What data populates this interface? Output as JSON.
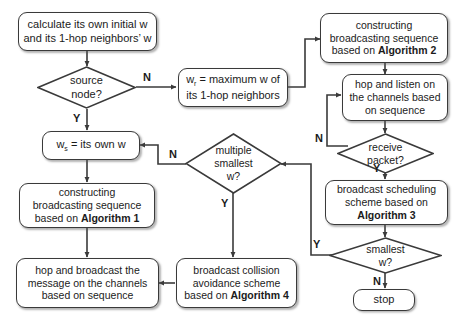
{
  "diagram": {
    "colors": {
      "stroke": "#3a3a3a",
      "text": "#1b1b1b",
      "background": "#ffffff"
    },
    "nodes": {
      "calc_initial_w": {
        "shape": "process",
        "line1": "calculate its own initial w",
        "line2": "and its 1-hop neighbors’ w"
      },
      "source_node": {
        "shape": "decision",
        "line1": "source",
        "line2": "node?"
      },
      "wr_max": {
        "shape": "process",
        "line1": "w",
        "sub1": "r",
        "line1b": " = maximum w of",
        "line2": "its 1-hop neighbors"
      },
      "ws_own": {
        "shape": "process",
        "line1": "w",
        "sub1": "s",
        "line1b": " = its own w"
      },
      "construct_alg1": {
        "shape": "process",
        "line1": "constructing",
        "line2": "broadcasting sequence",
        "line3_pre": "based on ",
        "line3_bold": "Algorithm 1"
      },
      "construct_alg2": {
        "shape": "process",
        "line1": "constructing",
        "line2": "broadcasting sequence",
        "line3_pre": "based on ",
        "line3_bold": "Algorithm 2"
      },
      "hop_listen": {
        "shape": "process",
        "line1": "hop and listen on",
        "line2": "the channels based",
        "line3": "on sequence"
      },
      "receive_packet": {
        "shape": "decision",
        "line1": "receive",
        "line2": "packet?"
      },
      "broadcast_sched_alg3": {
        "shape": "process",
        "line1": "broadcast scheduling",
        "line2": "scheme based on",
        "line3_bold": "Algorithm 3"
      },
      "smallest_w": {
        "shape": "decision",
        "line1": "smallest",
        "line2": "w?"
      },
      "stop": {
        "shape": "terminal",
        "line1": "stop"
      },
      "multiple_smallest_w": {
        "shape": "decision",
        "line1": "multiple",
        "line2": "smallest",
        "line3": "w?"
      },
      "collision_avoid_alg4": {
        "shape": "process",
        "line1": "broadcast collision",
        "line2": "avoidance scheme",
        "line3_pre": "based on ",
        "line3_bold": "Algorithm 4"
      },
      "hop_broadcast": {
        "shape": "process",
        "line1": "hop and broadcast the",
        "line2": "message on the channels",
        "line3": "based on sequence"
      }
    },
    "edge_labels": {
      "source_no": "N",
      "source_yes": "Y",
      "receive_no": "N",
      "receive_yes": "Y",
      "smallest_yes": "Y",
      "smallest_no": "N",
      "multiple_no": "N",
      "multiple_yes": "Y"
    }
  }
}
